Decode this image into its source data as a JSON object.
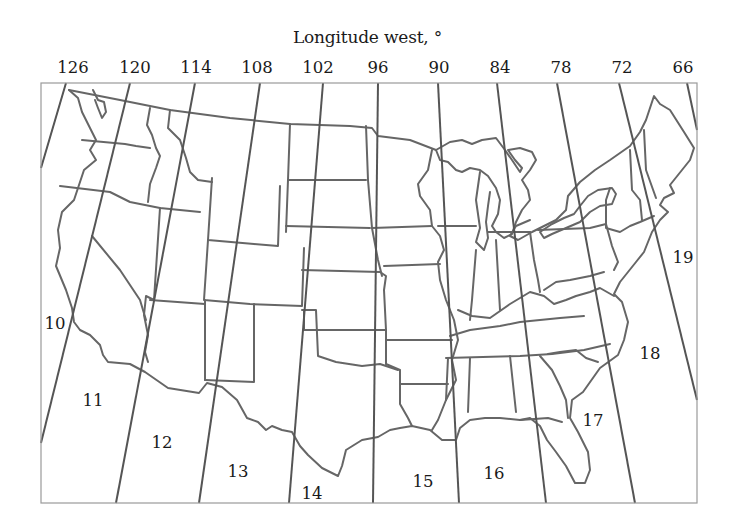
{
  "map": {
    "title": "Longitude west, °",
    "longitude_ticks": [
      {
        "label": "126",
        "x": 73
      },
      {
        "label": "120",
        "x": 135
      },
      {
        "label": "114",
        "x": 196
      },
      {
        "label": "108",
        "x": 257
      },
      {
        "label": "102",
        "x": 318
      },
      {
        "label": "96",
        "x": 378
      },
      {
        "label": "90",
        "x": 439
      },
      {
        "label": "84",
        "x": 500
      },
      {
        "label": "78",
        "x": 561
      },
      {
        "label": "72",
        "x": 622
      },
      {
        "label": "66",
        "x": 683
      }
    ],
    "zones": [
      {
        "label": "10",
        "x": 55,
        "y": 323
      },
      {
        "label": "11",
        "x": 93,
        "y": 400
      },
      {
        "label": "12",
        "x": 162,
        "y": 442
      },
      {
        "label": "13",
        "x": 238,
        "y": 471
      },
      {
        "label": "14",
        "x": 312,
        "y": 493
      },
      {
        "label": "15",
        "x": 423,
        "y": 481
      },
      {
        "label": "16",
        "x": 494,
        "y": 473
      },
      {
        "label": "17",
        "x": 593,
        "y": 420
      },
      {
        "label": "18",
        "x": 650,
        "y": 353
      },
      {
        "label": "19",
        "x": 683,
        "y": 257
      }
    ],
    "region": "Contiguous United States",
    "line_color": "#555555",
    "frame_color": "#9a9a9a"
  }
}
